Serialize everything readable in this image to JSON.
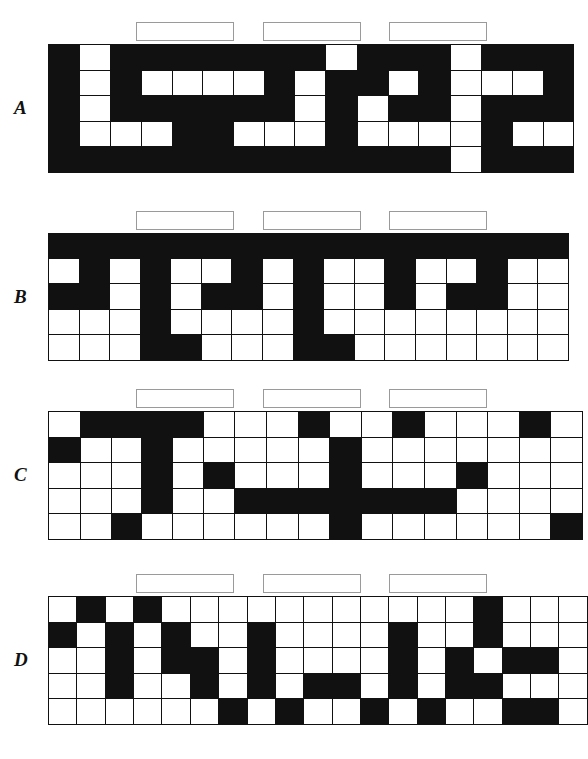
{
  "page": {
    "background_color": "#ffffff",
    "ink_color": "#111111",
    "box_border_color": "#9a9a9a",
    "grid_columns": 17,
    "grid_rows": 5,
    "answer_box_count_per_grid": 3,
    "answer_box_value": ""
  },
  "puzzles": [
    {
      "label": "A",
      "answer_boxes": [
        {
          "name": "answer-box-a-1",
          "value": ""
        },
        {
          "name": "answer-box-a-2",
          "value": ""
        },
        {
          "name": "answer-box-a-3",
          "value": ""
        }
      ],
      "grid": [
        [
          0,
          1,
          0,
          0,
          0,
          0,
          0,
          0,
          0,
          1,
          0,
          0,
          0,
          1,
          0,
          0,
          0
        ],
        [
          0,
          1,
          0,
          1,
          1,
          1,
          1,
          0,
          1,
          0,
          0,
          1,
          0,
          1,
          1,
          1,
          0
        ],
        [
          0,
          1,
          0,
          0,
          0,
          0,
          0,
          0,
          1,
          0,
          1,
          0,
          0,
          1,
          0,
          0,
          0
        ],
        [
          0,
          1,
          1,
          1,
          0,
          0,
          1,
          1,
          1,
          0,
          1,
          1,
          1,
          1,
          0,
          1,
          1
        ],
        [
          0,
          0,
          0,
          0,
          0,
          0,
          0,
          0,
          0,
          0,
          0,
          0,
          0,
          1,
          0,
          0,
          0
        ]
      ]
    },
    {
      "label": "B",
      "answer_boxes": [
        {
          "name": "answer-box-b-1",
          "value": ""
        },
        {
          "name": "answer-box-b-2",
          "value": ""
        },
        {
          "name": "answer-box-b-3",
          "value": ""
        }
      ],
      "grid": [
        [
          0,
          0,
          0,
          0,
          0,
          0,
          0,
          0,
          0,
          0,
          0,
          0,
          0,
          0,
          0,
          0,
          0
        ],
        [
          1,
          0,
          1,
          0,
          1,
          1,
          0,
          1,
          0,
          1,
          1,
          0,
          1,
          1,
          0,
          1,
          1
        ],
        [
          0,
          0,
          1,
          0,
          1,
          0,
          0,
          1,
          0,
          1,
          1,
          0,
          1,
          0,
          0,
          1,
          1
        ],
        [
          1,
          1,
          1,
          0,
          1,
          1,
          1,
          1,
          0,
          1,
          1,
          1,
          1,
          1,
          1,
          1,
          1
        ],
        [
          1,
          1,
          1,
          0,
          0,
          1,
          1,
          1,
          0,
          0,
          1,
          1,
          1,
          1,
          1,
          1,
          1
        ]
      ]
    },
    {
      "label": "C",
      "answer_boxes": [
        {
          "name": "answer-box-c-1",
          "value": ""
        },
        {
          "name": "answer-box-c-2",
          "value": ""
        },
        {
          "name": "answer-box-c-3",
          "value": ""
        }
      ],
      "grid": [
        [
          1,
          0,
          0,
          0,
          0,
          1,
          1,
          1,
          0,
          1,
          1,
          0,
          1,
          1,
          1,
          0,
          1
        ],
        [
          0,
          1,
          1,
          0,
          1,
          1,
          1,
          1,
          1,
          0,
          1,
          1,
          1,
          1,
          1,
          1,
          1
        ],
        [
          1,
          1,
          1,
          0,
          1,
          0,
          1,
          1,
          1,
          0,
          1,
          1,
          1,
          0,
          1,
          1,
          1
        ],
        [
          1,
          1,
          1,
          0,
          1,
          1,
          0,
          0,
          0,
          0,
          0,
          0,
          0,
          1,
          1,
          1,
          1
        ],
        [
          1,
          1,
          0,
          1,
          1,
          1,
          1,
          1,
          1,
          0,
          1,
          1,
          1,
          1,
          1,
          1,
          0
        ]
      ]
    },
    {
      "label": "D",
      "answer_boxes": [
        {
          "name": "answer-box-d-1",
          "value": ""
        },
        {
          "name": "answer-box-d-2",
          "value": ""
        },
        {
          "name": "answer-box-d-3",
          "value": ""
        }
      ],
      "grid": [
        [
          1,
          0,
          1,
          0,
          1,
          1,
          1,
          1,
          1,
          1,
          1,
          1,
          1,
          1,
          1,
          0,
          1,
          1,
          1
        ],
        [
          0,
          1,
          0,
          1,
          0,
          1,
          1,
          0,
          1,
          1,
          1,
          1,
          0,
          1,
          1,
          0,
          1,
          1,
          1
        ],
        [
          1,
          1,
          0,
          1,
          0,
          0,
          1,
          0,
          1,
          1,
          1,
          1,
          0,
          1,
          0,
          1,
          0,
          0,
          1
        ],
        [
          1,
          1,
          0,
          1,
          1,
          0,
          1,
          0,
          1,
          0,
          0,
          1,
          0,
          1,
          0,
          0,
          1,
          1,
          1
        ],
        [
          1,
          1,
          1,
          1,
          1,
          1,
          0,
          1,
          0,
          1,
          1,
          0,
          1,
          0,
          1,
          1,
          0,
          0,
          1
        ]
      ]
    }
  ]
}
